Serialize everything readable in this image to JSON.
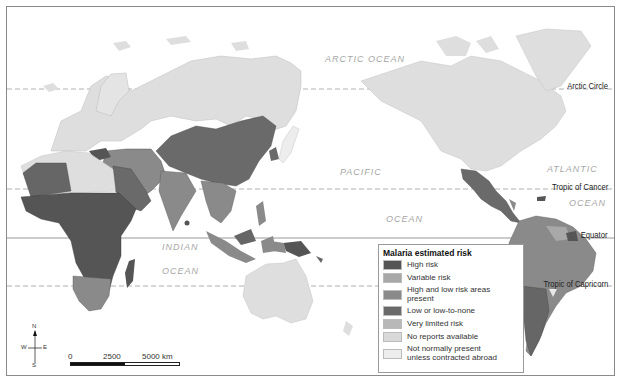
{
  "map": {
    "title": "Malaria estimated risk",
    "projection": "Pacific-centered world map",
    "oceans": [
      {
        "id": "arctic",
        "label": "ARCTIC OCEAN"
      },
      {
        "id": "pacific",
        "label": "PACIFIC"
      },
      {
        "id": "pacific2",
        "label": "OCEAN"
      },
      {
        "id": "atlantic",
        "label": "ATLANTIC"
      },
      {
        "id": "atlantic2",
        "label": "OCEAN"
      },
      {
        "id": "indian",
        "label": "INDIAN"
      },
      {
        "id": "indian2",
        "label": "OCEAN"
      }
    ],
    "latitude_lines": [
      {
        "id": "arctic-circle",
        "label": "Arctic Circle"
      },
      {
        "id": "tropic-cancer",
        "label": "Tropic of Cancer"
      },
      {
        "id": "equator",
        "label": "Equator"
      },
      {
        "id": "tropic-capricorn",
        "label": "Tropic of Capricorn"
      }
    ],
    "compass": {
      "n": "N",
      "s": "S",
      "e": "E",
      "w": "W"
    },
    "scale": {
      "labels": [
        "0",
        "2500",
        "5000 km"
      ]
    }
  },
  "legend": {
    "title": "Malaria estimated risk",
    "items": [
      {
        "label": "High risk",
        "color": "#555555"
      },
      {
        "label": "Variable risk",
        "color": "#a8a8a8"
      },
      {
        "label": "High and low risk areas present",
        "color": "#8a8a8a"
      },
      {
        "label": "Low or low-to-none",
        "color": "#6a6a6a"
      },
      {
        "label": "Very limited risk",
        "color": "#b8b8b8"
      },
      {
        "label": "No reports available",
        "color": "#d9d9d9"
      },
      {
        "label": "Not normally present unless contracted abroad",
        "color": "#ededed"
      }
    ]
  },
  "colors": {
    "land_default": "#dedede",
    "high_risk": "#555555",
    "variable": "#a8a8a8",
    "mixed": "#8a8a8a",
    "low": "#6a6a6a",
    "very_limited": "#b8b8b8",
    "no_reports": "#d9d9d9",
    "not_present": "#ededed"
  }
}
